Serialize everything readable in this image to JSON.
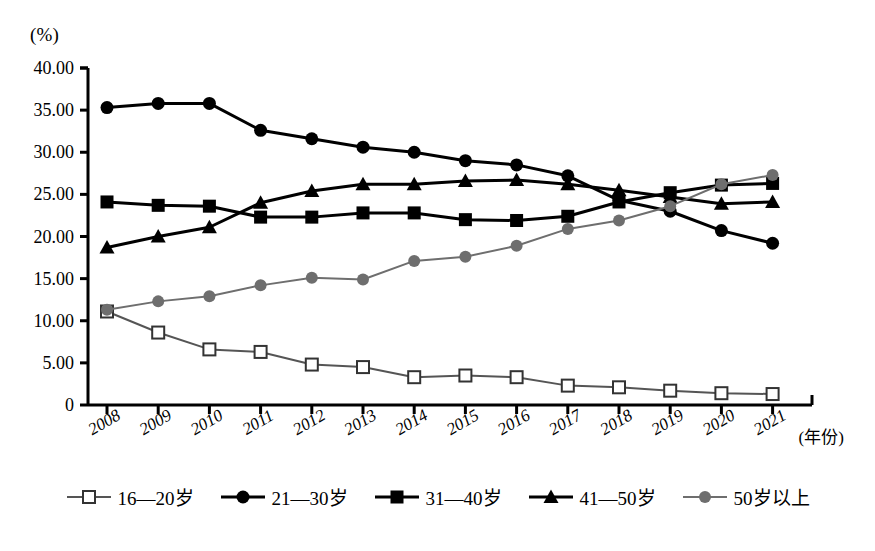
{
  "chart_data": {
    "type": "line",
    "title": "",
    "subtitle": "",
    "xlabel": "(年份)",
    "ylabel": "(%)",
    "ylim": [
      0,
      40
    ],
    "ytick_labels": [
      "40.00",
      "35.00",
      "30.00",
      "25.00",
      "20.00",
      "15.00",
      "10.00",
      "5.00",
      "0"
    ],
    "ytick_values": [
      40,
      35,
      30,
      25,
      20,
      15,
      10,
      5,
      0
    ],
    "grid": false,
    "legend_position": "bottom",
    "categories": [
      "2008",
      "2009",
      "2010",
      "2011",
      "2012",
      "2013",
      "2014",
      "2015",
      "2016",
      "2017",
      "2018",
      "2019",
      "2020",
      "2021"
    ],
    "x": [
      2008,
      2009,
      2010,
      2011,
      2012,
      2013,
      2014,
      2015,
      2016,
      2017,
      2018,
      2019,
      2020,
      2021
    ],
    "series": [
      {
        "name": "16—20岁",
        "marker": "open-square",
        "color": "#555555",
        "values": [
          11.1,
          8.6,
          6.6,
          6.3,
          4.8,
          4.5,
          3.3,
          3.5,
          3.3,
          2.3,
          2.1,
          1.7,
          1.4,
          1.3
        ]
      },
      {
        "name": "21—30岁",
        "marker": "filled-circle",
        "color": "#000000",
        "values": [
          35.3,
          35.8,
          35.8,
          32.6,
          31.6,
          30.6,
          30.0,
          29.0,
          28.5,
          27.2,
          24.3,
          23.0,
          20.7,
          19.2
        ]
      },
      {
        "name": "31—40岁",
        "marker": "filled-square",
        "color": "#000000",
        "values": [
          24.1,
          23.7,
          23.6,
          22.3,
          22.3,
          22.8,
          22.8,
          22.0,
          21.9,
          22.4,
          24.1,
          25.2,
          26.1,
          26.3
        ]
      },
      {
        "name": "41—50岁",
        "marker": "filled-triangle",
        "color": "#000000",
        "values": [
          18.7,
          20.0,
          21.1,
          24.0,
          25.4,
          26.2,
          26.2,
          26.6,
          26.7,
          26.2,
          25.5,
          24.7,
          23.9,
          24.1
        ]
      },
      {
        "name": "50岁以上",
        "marker": "filled-circle-gray",
        "color": "#6e6e6e",
        "values": [
          11.3,
          12.3,
          12.9,
          14.2,
          15.1,
          14.9,
          17.1,
          17.6,
          18.9,
          20.9,
          21.9,
          23.6,
          26.2,
          27.3
        ]
      }
    ]
  },
  "axes": {
    "y_unit": "(%)",
    "x_unit": "(年份)"
  },
  "legend": {
    "items": [
      {
        "label": "16—20岁",
        "marker": "open-square",
        "color": "#555555"
      },
      {
        "label": "21—30岁",
        "marker": "filled-circle",
        "color": "#000000"
      },
      {
        "label": "31—40岁",
        "marker": "filled-square",
        "color": "#000000"
      },
      {
        "label": "41—50岁",
        "marker": "filled-triangle",
        "color": "#000000"
      },
      {
        "label": "50岁以上",
        "marker": "filled-circle-gray",
        "color": "#6e6e6e"
      }
    ]
  }
}
